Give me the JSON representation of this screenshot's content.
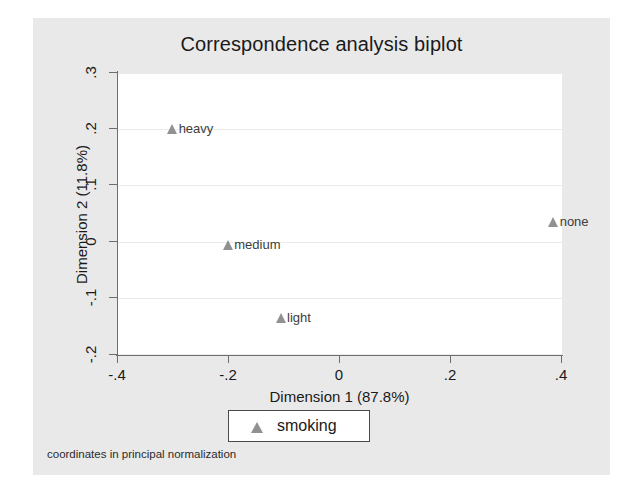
{
  "figure": {
    "title": "Correspondence analysis biplot",
    "note": "coordinates in principal normalization",
    "background_color": "#e9e9e9",
    "plot_background_color": "#ffffff",
    "marker_color": "#919191",
    "axis_color": "#6e6e6e",
    "grid_color": "#ebebeb"
  },
  "legend": {
    "entries": [
      {
        "label": "smoking",
        "marker": "triangle-up",
        "color": "#919191"
      }
    ]
  },
  "chart_data": {
    "type": "scatter",
    "title": "Correspondence analysis biplot",
    "subtitle": "",
    "xlabel": "Dimension 1 (87.8%)",
    "ylabel": "Dimension 2 (11.8%)",
    "xlim": [
      -0.4,
      0.4
    ],
    "ylim": [
      -0.2,
      0.3
    ],
    "xticks": [
      -0.4,
      -0.2,
      0,
      0.2,
      0.4
    ],
    "xticklabels": [
      "-.4",
      "-.2",
      "0",
      ".2",
      ".4"
    ],
    "yticks": [
      -0.2,
      -0.1,
      0,
      0.1,
      0.2,
      0.3
    ],
    "yticklabels": [
      "-.2",
      "-.1",
      "0",
      ".1",
      ".2",
      ".3"
    ],
    "grid": "horizontal",
    "legend_position": "below-axis-center",
    "annotation": "coordinates in principal normalization",
    "series": [
      {
        "name": "smoking",
        "marker": "triangle-up",
        "color": "#919191",
        "points": [
          {
            "label": "heavy",
            "x": -0.3,
            "y": 0.2
          },
          {
            "label": "medium",
            "x": -0.2,
            "y": -0.005
          },
          {
            "label": "light",
            "x": -0.105,
            "y": -0.135
          },
          {
            "label": "none",
            "x": 0.385,
            "y": 0.035
          }
        ]
      }
    ]
  }
}
